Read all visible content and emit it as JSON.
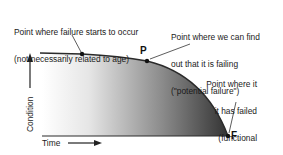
{
  "diagram": {
    "annotations": {
      "failure_start": {
        "line1": "Point where failure starts to occur",
        "line2": "(not necessarily related to age)"
      },
      "potential_failure": {
        "line1": "Point where we can find",
        "line2": "out that it is failing",
        "line3": "(\"potential failure\")"
      },
      "functional_failure": {
        "line1": "Point where it",
        "line2": "it has failed",
        "line3": "(functional",
        "line4": "failure)"
      }
    },
    "points": {
      "p_label": "P",
      "f_label": "F"
    },
    "axes": {
      "x_label": "Time",
      "y_label": "Condition"
    },
    "colors": {
      "curve": "#2a2a2a",
      "fill_light": "#ffffff",
      "fill_dark": "#3a3a3a",
      "text": "#1a1a1a"
    }
  }
}
